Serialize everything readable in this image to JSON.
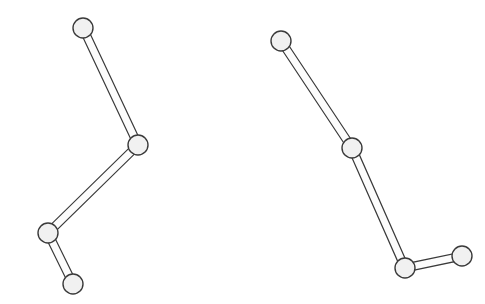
{
  "figure": {
    "background_color": "#ffffff",
    "width": 485,
    "height": 304,
    "style": {
      "joint_fill": "#f1f1f1",
      "joint_stroke": "#3a3a3a",
      "joint_radius": 10,
      "joint_stroke_width": 1.4,
      "rod_fill": "#fcfcfc",
      "rod_stroke": "#3a3a3a",
      "rod_stroke_width": 1.2,
      "rod_half_width": 4
    }
  },
  "chains": [
    {
      "name": "left-chain",
      "label": "Left linkage chain",
      "joints": [
        {
          "id": "L0",
          "label": "left-joint-top",
          "x": 83,
          "y": 28,
          "type": "endpoint"
        },
        {
          "id": "L1",
          "label": "left-joint-middle",
          "x": 138,
          "y": 145,
          "type": "pivot"
        },
        {
          "id": "L2",
          "label": "left-joint-lower",
          "x": 48,
          "y": 233,
          "type": "pivot"
        },
        {
          "id": "L3",
          "label": "left-joint-bottom",
          "x": 73,
          "y": 284,
          "type": "endpoint"
        }
      ],
      "links": [
        {
          "id": "LA",
          "label": "left-link-upper",
          "from": "L0",
          "to": "L1"
        },
        {
          "id": "LB",
          "label": "left-link-middle",
          "from": "L1",
          "to": "L2"
        },
        {
          "id": "LC",
          "label": "left-link-lower",
          "from": "L2",
          "to": "L3"
        }
      ]
    },
    {
      "name": "right-chain",
      "label": "Right linkage chain",
      "joints": [
        {
          "id": "R0",
          "label": "right-joint-top",
          "x": 281,
          "y": 41,
          "type": "endpoint"
        },
        {
          "id": "R1",
          "label": "right-joint-middle",
          "x": 352,
          "y": 148,
          "type": "pivot"
        },
        {
          "id": "R2",
          "label": "right-joint-lower",
          "x": 405,
          "y": 268,
          "type": "pivot"
        },
        {
          "id": "R3",
          "label": "right-joint-end",
          "x": 462,
          "y": 256,
          "type": "endpoint"
        }
      ],
      "links": [
        {
          "id": "RA",
          "label": "right-link-upper",
          "from": "R0",
          "to": "R1"
        },
        {
          "id": "RB",
          "label": "right-link-middle",
          "from": "R1",
          "to": "R2"
        },
        {
          "id": "RC",
          "label": "right-link-lower",
          "from": "R2",
          "to": "R3"
        }
      ]
    }
  ]
}
